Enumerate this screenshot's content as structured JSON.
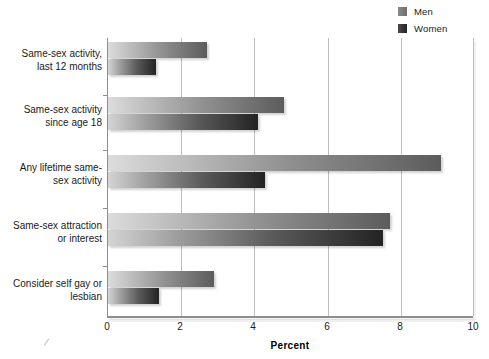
{
  "chart_data": {
    "type": "bar",
    "orientation": "horizontal",
    "title": "",
    "xlabel": "Percent",
    "ylabel": "",
    "xlim": [
      0,
      10
    ],
    "xticks": [
      0,
      2,
      4,
      6,
      8,
      10
    ],
    "xtick_labels": [
      "0",
      "2",
      "4",
      "6",
      "8",
      "10"
    ],
    "grid": "vertical",
    "legend_position": "top-right",
    "categories": [
      "Same-sex activity, last 12 months",
      "Same-sex activity since age 18",
      "Any lifetime same-sex activity",
      "Same-sex attraction or interest",
      "Consider self gay or lesbian"
    ],
    "category_lines": [
      [
        "Same-sex activity,",
        "last 12 months"
      ],
      [
        "Same-sex activity",
        "since age 18"
      ],
      [
        "Any lifetime same-",
        "sex activity"
      ],
      [
        "Same-sex attraction",
        "or interest"
      ],
      [
        "Consider self gay or",
        "lesbian"
      ]
    ],
    "series": [
      {
        "name": "Men",
        "color": "#6e6e6e",
        "values": [
          2.7,
          4.8,
          9.1,
          7.7,
          2.9
        ]
      },
      {
        "name": "Women",
        "color": "#242424",
        "values": [
          1.3,
          4.1,
          4.3,
          7.5,
          1.4
        ]
      }
    ]
  },
  "legend": {
    "items": [
      {
        "label": "Men"
      },
      {
        "label": "Women"
      }
    ]
  },
  "axis": {
    "x_title": "Percent",
    "tick_0": "0",
    "tick_2": "2",
    "tick_4": "4",
    "tick_6": "6",
    "tick_8": "8",
    "tick_10": "10"
  },
  "marks": {
    "corner_scuff": "/"
  }
}
